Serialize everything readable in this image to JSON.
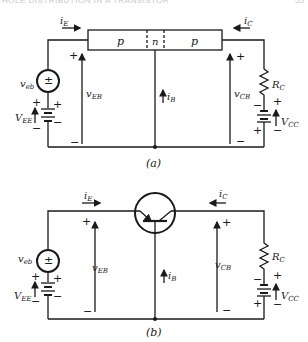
{
  "header": {
    "text": "HOLE DISTRIBUTION IN A TRANSISTOR",
    "page": "55"
  },
  "circuit_a": {
    "caption": "(a)",
    "regions": [
      "p",
      "n",
      "p"
    ],
    "labels": {
      "i_E": "i",
      "i_E_sub": "E",
      "i_C": "i",
      "i_C_sub": "C",
      "i_B": "i",
      "i_B_sub": "B",
      "v_EB": "v",
      "v_EB_sub": "EB",
      "v_CB": "v",
      "v_CB_sub": "CB",
      "v_eb": "v",
      "v_eb_sub": "eb",
      "V_EE": "V",
      "V_EE_sub": "EE",
      "V_CC": "V",
      "V_CC_sub": "CC",
      "R_C": "R",
      "R_C_sub": "C"
    }
  },
  "circuit_b": {
    "caption": "(b)",
    "labels": {
      "i_E": "i",
      "i_E_sub": "E",
      "i_C": "i",
      "i_C_sub": "C",
      "i_B": "i",
      "i_B_sub": "B",
      "v_EB": "v",
      "v_EB_sub": "EB",
      "v_CB": "v",
      "v_CB_sub": "CB",
      "v_eb": "v",
      "v_eb_sub": "eb",
      "V_EE": "V",
      "V_EE_sub": "EE",
      "V_CC": "V",
      "V_CC_sub": "CC",
      "R_C": "R",
      "R_C_sub": "C"
    }
  },
  "symbols": {
    "plus": "+",
    "minus": "−",
    "source_sign": "±"
  }
}
